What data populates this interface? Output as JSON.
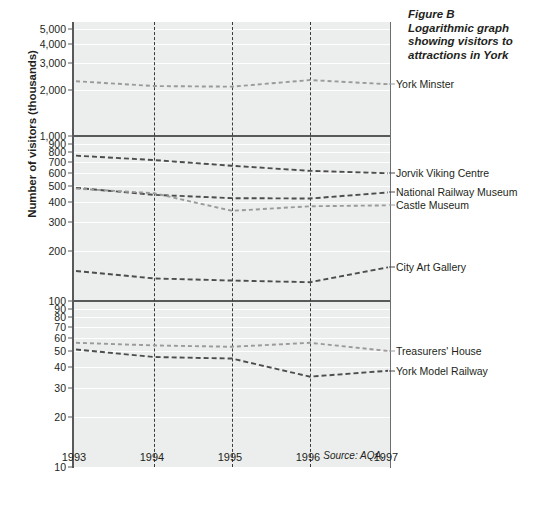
{
  "figure": {
    "caption_lines": [
      "Figure B",
      "Logarithmic graph",
      "showing visitors to",
      "attractions in York"
    ],
    "source_note": "Source: AQA.",
    "y_axis_title": "Number of visitors (thousands)"
  },
  "chart_data": {
    "type": "line",
    "title": "Logarithmic graph showing visitors to attractions in York",
    "xlabel": "",
    "ylabel": "Number of visitors (thousands)",
    "yscale": "log",
    "ylim": [
      10,
      5000
    ],
    "grid": true,
    "legend_position": "right-of-plot (inline series labels)",
    "x": [
      1993,
      1994,
      1995,
      1996,
      1997
    ],
    "xtick_labels": [
      "1993",
      "1994",
      "1995",
      "1996",
      "1997"
    ],
    "ytick_labels": [
      "5,000",
      "4,000",
      "3,000",
      "2,000",
      "1,000",
      "900",
      "800",
      "700",
      "600",
      "500",
      "400",
      "300",
      "200",
      "100",
      "90",
      "80",
      "70",
      "60",
      "50",
      "40",
      "30",
      "20",
      "10"
    ],
    "ytick_values": [
      5000,
      4000,
      3000,
      2000,
      1000,
      900,
      800,
      700,
      600,
      500,
      400,
      300,
      200,
      100,
      90,
      80,
      70,
      60,
      50,
      40,
      30,
      20,
      10
    ],
    "band_dividers": [
      1000,
      100
    ],
    "series": [
      {
        "name": "York Minster",
        "label": "York Minster",
        "color": "#9a9a9a",
        "dash": "4,3",
        "values": [
          2280,
          2120,
          2100,
          2320,
          2180
        ]
      },
      {
        "name": "Jorvik Viking Centre",
        "label": "Jorvik Viking Centre",
        "color": "#4d4d4d",
        "dash": "5,3",
        "values": [
          760,
          715,
          660,
          615,
          595
        ]
      },
      {
        "name": "National Railway Museum",
        "label": "National Railway Museum",
        "color": "#4d4d4d",
        "dash": "5,3",
        "values": [
          485,
          440,
          420,
          418,
          455
        ]
      },
      {
        "name": "Castle Museum",
        "label": "Castle Museum",
        "color": "#9a9a9a",
        "dash": "4,3",
        "values": [
          480,
          450,
          352,
          375,
          380
        ]
      },
      {
        "name": "City Art Gallery",
        "label": "City Art Gallery",
        "color": "#4d4d4d",
        "dash": "5,3",
        "values": [
          152,
          137,
          133,
          130,
          160
        ]
      },
      {
        "name": "Treasurers' House",
        "label": "Treasurers' House",
        "color": "#9a9a9a",
        "dash": "4,3",
        "values": [
          56,
          54,
          53,
          56,
          50
        ]
      },
      {
        "name": "York Model Railway",
        "label": "York Model Railway",
        "color": "#4d4d4d",
        "dash": "5,3",
        "values": [
          51,
          46,
          45,
          35,
          38
        ]
      }
    ]
  }
}
